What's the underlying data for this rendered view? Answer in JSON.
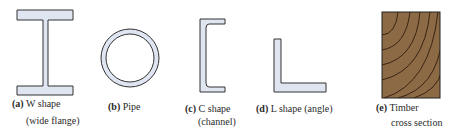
{
  "figure": {
    "colors": {
      "steel_fill": "#dfe6f2",
      "outline": "#333333",
      "timber_fill": "#8b6a45",
      "grain": "#3a2412"
    },
    "items": [
      {
        "tag": "(a)",
        "name": "W shape",
        "sub": "(wide flange)"
      },
      {
        "tag": "(b)",
        "name": "Pipe",
        "sub": ""
      },
      {
        "tag": "(c)",
        "name": "C shape",
        "sub": "(channel)"
      },
      {
        "tag": "(d)",
        "name": "L shape (angle)",
        "sub": ""
      },
      {
        "tag": "(e)",
        "name": "Timber",
        "sub": "cross section"
      }
    ]
  }
}
